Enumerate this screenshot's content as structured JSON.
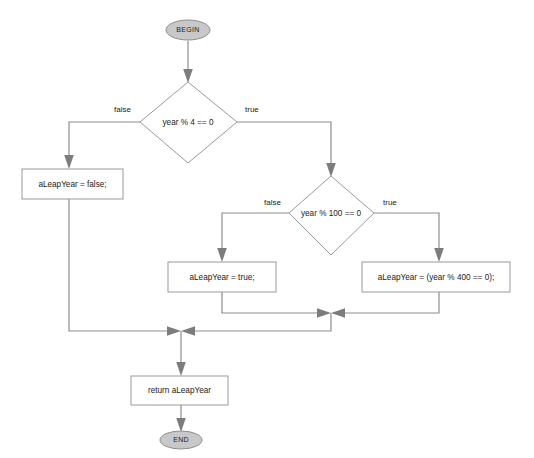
{
  "diagram": {
    "colors": {
      "terminal_fill": "#c8c8c8",
      "node_stroke": "#9a9a9a",
      "edge_stroke": "#8e8e8e",
      "arrow_fill": "#7c7c7c",
      "text": "#1a1a1a",
      "background": "#ffffff"
    },
    "nodes": {
      "begin": {
        "label": "BEGIN",
        "shape": "terminal"
      },
      "decision_year_mod_4": {
        "label": "year % 4 == 0",
        "shape": "diamond"
      },
      "assign_false": {
        "label": "aLeapYear = false;",
        "shape": "process"
      },
      "decision_year_mod_100": {
        "label": "year % 100 == 0",
        "shape": "diamond"
      },
      "assign_true": {
        "label": "aLeapYear = true;",
        "shape": "process"
      },
      "assign_mod_400": {
        "label": "aLeapYear = (year % 400 == 0);",
        "shape": "process"
      },
      "return_statement": {
        "label": "return aLeapYear",
        "shape": "process"
      },
      "end": {
        "label": "END",
        "shape": "terminal"
      }
    },
    "edge_labels": {
      "mod4_false": "false",
      "mod4_true": "true",
      "mod100_false": "false",
      "mod100_true": "true"
    }
  }
}
